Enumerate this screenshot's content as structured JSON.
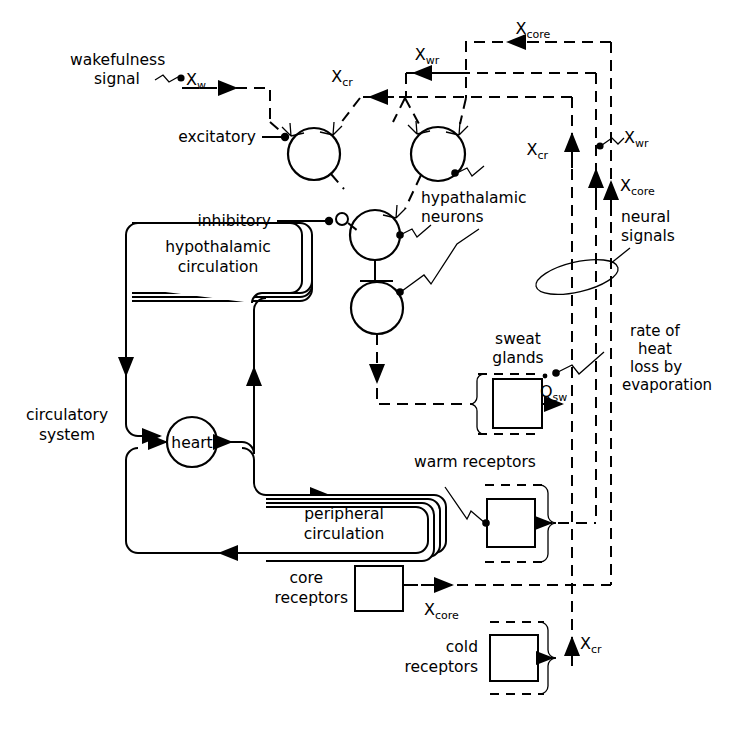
{
  "figure": {
    "type": "block-diagram",
    "background": "#ffffff",
    "stroke_color": "#000000"
  },
  "labels": {
    "wakefulness_signal": "wakefulness",
    "wakefulness_signal2": "signal",
    "excitatory": "excitatory",
    "inhibitory": "inhibitory",
    "hypothalamic_neurons_1": "hypathalamic",
    "hypothalamic_neurons_2": "neurons",
    "hypothalamic_circulation_1": "hypothalamic",
    "hypothalamic_circulation_2": "circulation",
    "peripheral_circulation_1": "peripheral",
    "peripheral_circulation_2": "circulation",
    "circulatory_system_1": "circulatory",
    "circulatory_system_2": "system",
    "heart": "heart",
    "sweat_glands_1": "sweat",
    "sweat_glands_2": "glands",
    "warm_receptors": "warm receptors",
    "core_receptors_1": "core",
    "core_receptors_2": "receptors",
    "cold_receptors_1": "cold",
    "cold_receptors_2": "receptors",
    "neural_signals_1": "neural",
    "neural_signals_2": "signals",
    "rate_of_heat_1": "rate of",
    "rate_of_heat_2": "heat",
    "rate_of_heat_3": "loss by",
    "rate_of_heat_4": "evaporation"
  },
  "variables": {
    "x_w": {
      "base": "X",
      "sub": "w"
    },
    "x_cr_top": {
      "base": "X",
      "sub": "cr"
    },
    "x_wr_top": {
      "base": "X",
      "sub": "wr"
    },
    "x_core_top": {
      "base": "X",
      "sub": "core"
    },
    "x_cr_right": {
      "base": "X",
      "sub": "cr"
    },
    "x_wr_right": {
      "base": "X",
      "sub": "wr"
    },
    "x_core_right": {
      "base": "X",
      "sub": "core"
    },
    "q_sw": {
      "base": "Q",
      "sub": "sw",
      "dot": true
    },
    "x_core_bottom": {
      "base": "X",
      "sub": "core"
    },
    "x_cr_bottom": {
      "base": "X",
      "sub": "cr"
    }
  },
  "nodes": {
    "neuron_excitatory": {
      "name": "excitatory neuron",
      "shape": "circle"
    },
    "neuron_warm": {
      "name": "warm-sensitive neuron",
      "shape": "circle"
    },
    "neuron_middle": {
      "name": "interneuron",
      "shape": "circle"
    },
    "neuron_output": {
      "name": "effector neuron",
      "shape": "circle"
    },
    "heart": {
      "name": "heart",
      "shape": "circle"
    },
    "sweat_glands": {
      "name": "sweat glands",
      "shape": "box"
    },
    "warm_receptors": {
      "name": "warm receptors",
      "shape": "box"
    },
    "core_receptors": {
      "name": "core receptors",
      "shape": "box"
    },
    "cold_receptors": {
      "name": "cold receptors",
      "shape": "box"
    },
    "hypothalamic_circulation": {
      "name": "hypothalamic circulation",
      "shape": "stacked-rounded-box"
    },
    "peripheral_circulation": {
      "name": "peripheral circulation",
      "shape": "stacked-rounded-box"
    }
  }
}
